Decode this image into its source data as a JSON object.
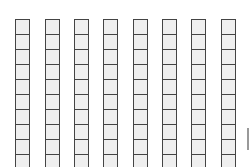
{
  "grid": {
    "columns": 8,
    "rows_visible": 10,
    "column_x": [
      15,
      45,
      74,
      103,
      133,
      162,
      191,
      221
    ],
    "cell_fill": "#efefef",
    "cell_border": "#444444"
  },
  "edge_marker": {
    "color": "#999999"
  }
}
